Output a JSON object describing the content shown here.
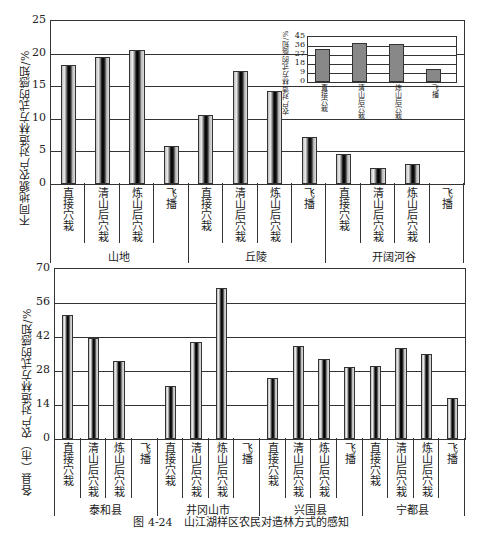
{
  "caption": "图 4-24　山江湖样区农民对造林方式的感知",
  "chart_data": [
    {
      "type": "bar",
      "title": "",
      "ylabel": "不同地貌农户对造林方式的感知/%",
      "xlabel": "",
      "ylim": [
        0,
        25
      ],
      "yticks": [
        "0",
        "5",
        "10",
        "15",
        "20",
        "25"
      ],
      "grid": true,
      "groups": [
        "山地",
        "丘陵",
        "开阔河谷"
      ],
      "categories": [
        "直接穴栽",
        "清山后穴栽",
        "炼山后穴栽",
        "飞播"
      ],
      "series": [
        {
          "name": "山地",
          "values": [
            18.2,
            19.5,
            20.6,
            5.8
          ]
        },
        {
          "name": "丘陵",
          "values": [
            10.6,
            17.4,
            14.2,
            7.2
          ]
        },
        {
          "name": "开阔河谷",
          "values": [
            4.6,
            2.4,
            3.0,
            0
          ]
        }
      ]
    },
    {
      "type": "bar",
      "title": "",
      "ylabel": "农户对造林方式的感知/%",
      "ylim": [
        0,
        45
      ],
      "yticks": [
        "0",
        "9",
        "18",
        "27",
        "36",
        "45"
      ],
      "grid": true,
      "categories": [
        "直接穴栽",
        "清山后穴栽",
        "炼山后穴栽",
        "飞播"
      ],
      "values": [
        33,
        39,
        38,
        13
      ]
    },
    {
      "type": "bar",
      "title": "",
      "ylabel": "各县（市）农户对造林方式的感知/%",
      "xlabel": "",
      "ylim": [
        0,
        70
      ],
      "yticks": [
        "0",
        "14",
        "28",
        "42",
        "56",
        "70"
      ],
      "grid": true,
      "groups": [
        "泰和县",
        "井冈山市",
        "兴国县",
        "宁都县"
      ],
      "categories": [
        "直接穴栽",
        "清山后穴栽",
        "炼山后穴栽",
        "飞播"
      ],
      "series": [
        {
          "name": "泰和县",
          "values": [
            51,
            41.5,
            32,
            0
          ]
        },
        {
          "name": "井冈山市",
          "values": [
            22,
            40,
            62,
            0
          ]
        },
        {
          "name": "兴国县",
          "values": [
            25,
            38.5,
            33,
            29.5
          ]
        },
        {
          "name": "宁都县",
          "values": [
            30,
            37.5,
            35,
            17
          ]
        }
      ]
    }
  ]
}
